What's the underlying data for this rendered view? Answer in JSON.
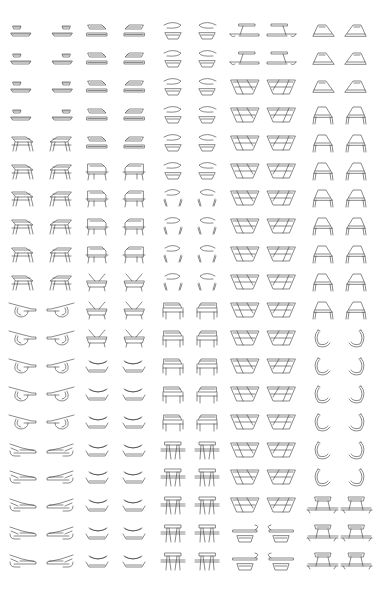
{
  "figure": {
    "background": "#ffffff",
    "stroke_color": "#3a3a3a",
    "columns": 10,
    "rows": 20,
    "column_centers_x": [
      24,
      59,
      98,
      133,
      173,
      207,
      245,
      281,
      322,
      357
    ],
    "row_first_center_y": 32,
    "row_spacing": 27.9,
    "column_groups": [
      {
        "name": "bench-to-lounger",
        "columns": [
          0,
          1
        ],
        "stages": [
          "double-bench",
          "double-bench",
          "double-bench",
          "double-bench",
          "table-tilted",
          "table-tilted",
          "table-tilted",
          "table-tilted",
          "table-tilted",
          "table-tilted",
          "lounger-loop",
          "lounger-loop",
          "lounger-loop",
          "lounger-loop",
          "lounger-loop",
          "lounger",
          "lounger",
          "lounger",
          "lounger",
          "lounger"
        ]
      },
      {
        "name": "tray-to-stacked-bowls",
        "columns": [
          2,
          3
        ],
        "stages": [
          "flat-trays",
          "flat-trays",
          "flat-trays",
          "flat-trays",
          "flat-trays",
          "boxy-chair",
          "boxy-chair",
          "boxy-chair",
          "boxy-chair",
          "cross-chair",
          "cross-chair",
          "cross-chair",
          "bowls",
          "bowls",
          "bowls",
          "bowls",
          "bowls",
          "bowls",
          "bowls",
          "bowls"
        ]
      },
      {
        "name": "hook-bowl-to-picnic-table",
        "columns": [
          4,
          5
        ],
        "stages": [
          "hook-bowl",
          "hook-bowl",
          "hook-bowl",
          "hook-bowl",
          "hook-bowl",
          "hook-bowl",
          "hook-legs",
          "hook-legs",
          "hook-legs",
          "hook-legs",
          "armchair",
          "armchair",
          "armchair",
          "armchair",
          "armchair",
          "picnic-table",
          "picnic-table",
          "picnic-table",
          "picnic-table",
          "picnic-table"
        ]
      },
      {
        "name": "z-bench-to-sofa",
        "columns": [
          6,
          7
        ],
        "stages": [
          "z-bench",
          "z-bench",
          "trough",
          "trough",
          "trough",
          "trough",
          "trough",
          "trough",
          "trough",
          "trough",
          "trough",
          "trough",
          "trough",
          "trough",
          "trough",
          "trough",
          "trough",
          "trough",
          "bench-hook",
          "bench-hook"
        ]
      },
      {
        "name": "wedge-to-table",
        "columns": [
          8,
          9
        ],
        "stages": [
          "wedge",
          "wedge",
          "wedge",
          "wedge-legs",
          "wedge-legs",
          "wedge-legs",
          "wedge-legs",
          "wedge-legs",
          "wedge-legs",
          "wedge-legs",
          "wedge-legs",
          "c-hook",
          "c-hook",
          "c-hook",
          "c-hook",
          "c-hook",
          "c-hook",
          "picnic-bench",
          "picnic-bench",
          "picnic-bench"
        ]
      }
    ]
  }
}
